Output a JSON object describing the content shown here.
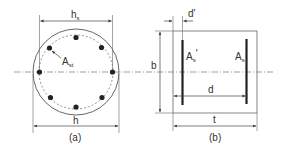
{
  "figure_a": {
    "caption": "(a)",
    "dim_hs_label": "h",
    "dim_hs_sub": "s",
    "dim_h_label": "h",
    "bar_area_label": "A",
    "bar_area_sub": "st",
    "bar_count": 8
  },
  "figure_b": {
    "caption": "(b)",
    "dim_dprime_label": "d'",
    "dim_b_label": "b",
    "dim_d_label": "d",
    "dim_t_label": "t",
    "bar_left_label": "A",
    "bar_left_sub": "s",
    "bar_left_prime": "'",
    "bar_right_label": "A",
    "bar_right_sub": "s"
  },
  "colors": {
    "line": "#555555",
    "bar": "#222222",
    "text": "#333333"
  }
}
